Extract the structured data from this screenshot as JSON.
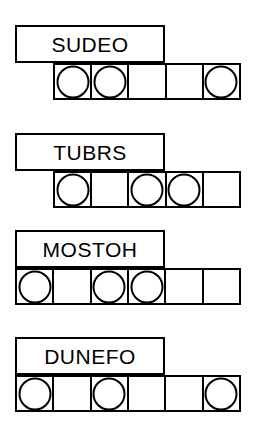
{
  "sheet": {
    "title": "Word Shape Puzzle Worksheet",
    "ink_color": "#000000",
    "paper_color": "#ffffff",
    "cell_count_default": 5
  },
  "puzzles": [
    {
      "id": "puzzle-1",
      "word": "SUDEO",
      "letter_count": 5,
      "box": {
        "left": 15,
        "top": 25,
        "width": 150,
        "height": 38
      },
      "row": {
        "left": 53,
        "top": 63,
        "width": 188,
        "height": 37,
        "cells": 5
      },
      "cells": [
        {
          "index": 1,
          "marked": true
        },
        {
          "index": 2,
          "marked": true
        },
        {
          "index": 3,
          "marked": false
        },
        {
          "index": 4,
          "marked": false
        },
        {
          "index": 5,
          "marked": true
        }
      ]
    },
    {
      "id": "puzzle-2",
      "word": "TUBRS",
      "letter_count": 5,
      "box": {
        "left": 15,
        "top": 133,
        "width": 150,
        "height": 38
      },
      "row": {
        "left": 53,
        "top": 171,
        "width": 188,
        "height": 37,
        "cells": 5
      },
      "cells": [
        {
          "index": 1,
          "marked": true
        },
        {
          "index": 2,
          "marked": false
        },
        {
          "index": 3,
          "marked": true
        },
        {
          "index": 4,
          "marked": true
        },
        {
          "index": 5,
          "marked": false
        }
      ]
    },
    {
      "id": "puzzle-3",
      "word": "MOSTOH",
      "letter_count": 6,
      "box": {
        "left": 15,
        "top": 230,
        "width": 150,
        "height": 38
      },
      "row": {
        "left": 15,
        "top": 268,
        "width": 226,
        "height": 37,
        "cells": 6
      },
      "cells": [
        {
          "index": 1,
          "marked": true
        },
        {
          "index": 2,
          "marked": false
        },
        {
          "index": 3,
          "marked": true
        },
        {
          "index": 4,
          "marked": true
        },
        {
          "index": 5,
          "marked": false
        },
        {
          "index": 6,
          "marked": false
        }
      ]
    },
    {
      "id": "puzzle-4",
      "word": "DUNEFO",
      "letter_count": 6,
      "box": {
        "left": 15,
        "top": 337,
        "width": 150,
        "height": 38
      },
      "row": {
        "left": 15,
        "top": 375,
        "width": 226,
        "height": 37,
        "cells": 6
      },
      "cells": [
        {
          "index": 1,
          "marked": true
        },
        {
          "index": 2,
          "marked": false
        },
        {
          "index": 3,
          "marked": true
        },
        {
          "index": 4,
          "marked": false
        },
        {
          "index": 5,
          "marked": false
        },
        {
          "index": 6,
          "marked": true
        }
      ]
    }
  ]
}
